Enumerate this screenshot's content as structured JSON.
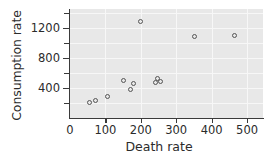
{
  "chart_data": {
    "type": "scatter",
    "title": "",
    "xlabel": "Death rate",
    "ylabel": "Consumption rate",
    "xlim": [
      0,
      545
    ],
    "ylim": [
      0,
      1450
    ],
    "grid": true,
    "legend": null,
    "marker": "open-circle",
    "xticks": [
      0,
      100,
      200,
      300,
      400,
      500
    ],
    "xtick_labels": [
      "0",
      "100",
      "200",
      "300",
      "400",
      "500"
    ],
    "yticks": [
      400,
      800,
      1200
    ],
    "ytick_labels": [
      "400",
      "800",
      "1200"
    ],
    "y_minor_ticks": [
      200,
      600,
      1000,
      1400
    ],
    "points": [
      {
        "x": 55,
        "y": 210
      },
      {
        "x": 72,
        "y": 235
      },
      {
        "x": 105,
        "y": 290
      },
      {
        "x": 150,
        "y": 500
      },
      {
        "x": 170,
        "y": 380
      },
      {
        "x": 178,
        "y": 460
      },
      {
        "x": 200,
        "y": 1290
      },
      {
        "x": 240,
        "y": 470
      },
      {
        "x": 248,
        "y": 520
      },
      {
        "x": 256,
        "y": 485
      },
      {
        "x": 352,
        "y": 1090
      },
      {
        "x": 465,
        "y": 1100
      }
    ],
    "colors": {
      "panel_background": "#e8e8e8",
      "gridline": "#f7f7f7",
      "marker_edge": "#555555",
      "axis": "#3a3a3a",
      "text": "#2b2b2b",
      "figure_background": "#ffffff"
    }
  }
}
